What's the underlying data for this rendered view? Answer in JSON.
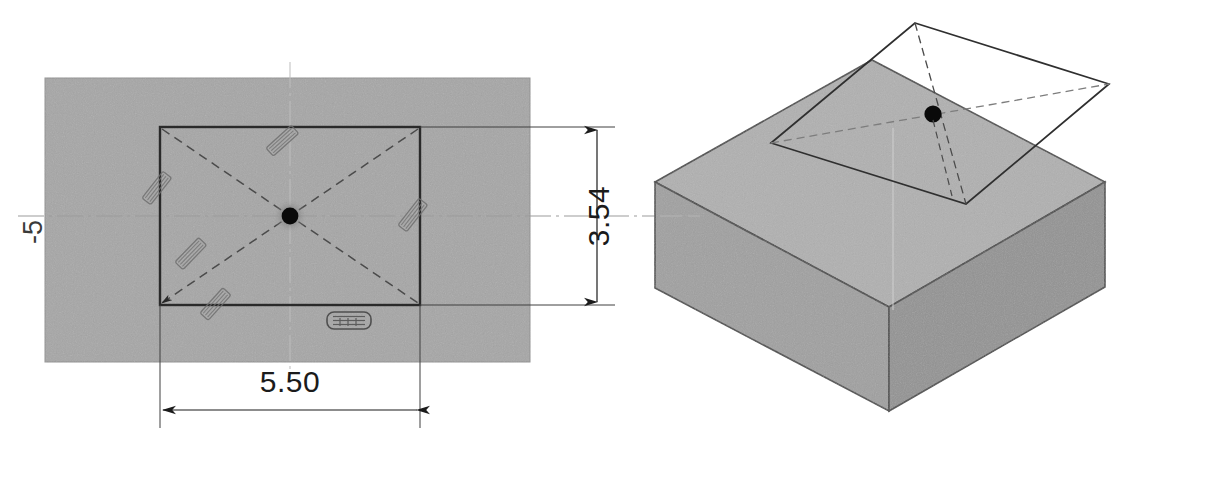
{
  "drawing": {
    "title": "Mechanical part orthographic and isometric drawing",
    "background_color": "#ffffff",
    "fill_gray": "#a6a6a6",
    "fill_gray_dark": "#949494",
    "fill_gray_light": "#b3b3b3",
    "line_color": "#1b1b1b",
    "thin_line_color": "#555555",
    "centerline_color": "#8d8d8d",
    "marker_color": "#000000"
  },
  "plan_view": {
    "name": "Top / plan view of rectangular plate with central hole",
    "outer_plate": {
      "label": "outer-plate-outline",
      "x": 45,
      "y": 78,
      "width": 485,
      "height": 284
    },
    "inner_pocket": {
      "label": "inner-rectangular-pocket",
      "x": 160,
      "y": 127,
      "width": 260,
      "height": 178
    },
    "center_hole": {
      "label": "center-hole-marker",
      "cx": 290,
      "cy": 216,
      "r": 8
    },
    "diagonals_style": "dashed",
    "hatch_marks_count": 5,
    "badge_label": "surface-finish-badge"
  },
  "dimensions": {
    "vertical": {
      "value": "3.54",
      "orientation": "rotated-90",
      "text_x": 598,
      "text_y": 216,
      "line_x": 597,
      "y_top": 127,
      "y_bottom": 305
    },
    "horizontal": {
      "value": "5.50",
      "orientation": "horizontal",
      "text_x": 290,
      "text_y": 390,
      "line_y": 410,
      "x_left": 160,
      "x_right": 420
    },
    "datum_label": {
      "value": "-5",
      "orientation": "rotated-90",
      "text_x": 33,
      "text_y": 232
    }
  },
  "iso_view": {
    "name": "Isometric view of block with floating sectioning plane",
    "block_label": "isometric-block",
    "plane_label": "floating-section-plane",
    "dot_label": "iso-center-hole-marker",
    "dot_cx": 933,
    "dot_cy": 114,
    "plane_style": "solid outline with dashed diagonals"
  }
}
